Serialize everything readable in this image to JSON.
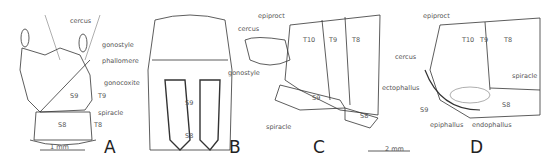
{
  "figure": {
    "panels": [
      {
        "id": "A",
        "labels": {
          "cercus": "cercus",
          "gonostyle": "gonostyle",
          "phallomere": "phallomere",
          "gonocoxite": "gonocoxite",
          "s9": "S9",
          "t9": "T9",
          "spiracle": "spiracle",
          "s8": "S8",
          "t8": "T8"
        },
        "scale": "1 mm"
      },
      {
        "id": "B",
        "labels": {
          "cercus": "cercus",
          "gonostyle": "gonostyle",
          "s9": "S9",
          "s8": "S8",
          "spiracle": "spiracle"
        }
      },
      {
        "id": "C",
        "labels": {
          "epiproct": "epiproct",
          "t10": "T10",
          "t9": "T9",
          "t8": "T8",
          "s9": "S9",
          "s8": "S8"
        },
        "scale": "2 mm"
      },
      {
        "id": "D",
        "labels": {
          "epiproct": "epiproct",
          "t10": "T10",
          "t9": "T9",
          "t8": "T8",
          "cercus": "cercus",
          "ectophallus": "ectophallus",
          "spiracle": "spiracle",
          "s9": "S9",
          "s8": "S8",
          "epiphallus": "epiphallus",
          "endophallus": "endophallus"
        }
      }
    ]
  }
}
